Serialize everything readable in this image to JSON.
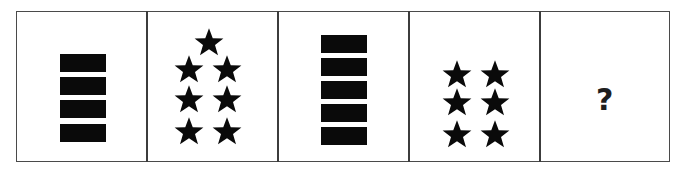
{
  "puzzle": {
    "panels": [
      {
        "index": 1,
        "type": "bars",
        "count": 4
      },
      {
        "index": 2,
        "type": "stars",
        "count": 7
      },
      {
        "index": 3,
        "type": "bars",
        "count": 5
      },
      {
        "index": 4,
        "type": "stars",
        "count": 6
      },
      {
        "index": 5,
        "type": "unknown",
        "label": "?"
      }
    ],
    "colors": {
      "shape": "#0a0a0a",
      "border": "#4a4a4a",
      "background": "#ffffff"
    },
    "icons": {
      "bar": "black-rectangle",
      "star": "black-star"
    }
  }
}
